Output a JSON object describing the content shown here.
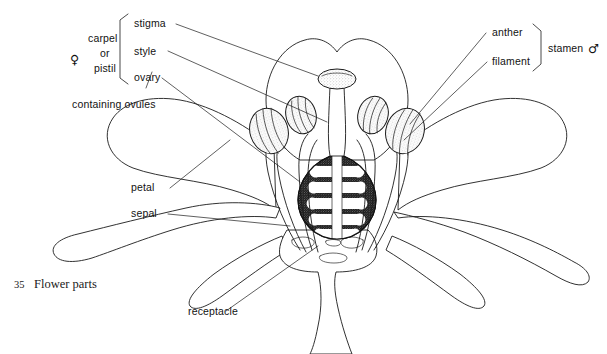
{
  "figure": {
    "caption_number": "35",
    "caption_text": "Flower parts"
  },
  "labels": {
    "stigma": "stigma",
    "style": "style",
    "ovary": "ovary",
    "containing_ovules": "containing ovules",
    "petal": "petal",
    "sepal": "sepal",
    "receptacle": "receptacle",
    "anther": "anther",
    "filament": "filament"
  },
  "groups": {
    "carpel_line1": "carpel",
    "carpel_line2": "or",
    "carpel_line3": "pistil",
    "female_symbol": "♀",
    "stamen": "stamen",
    "male_symbol": "♂"
  },
  "colors": {
    "ink": "#1b1b1b",
    "paper": "#ffffff",
    "stipple": "#b9b9b9",
    "ovary_wall": "#1a1a1a"
  },
  "structure": {
    "anther_count": 4,
    "ovule_pairs": 5,
    "petal_count": 3,
    "sepal_count": 4
  }
}
